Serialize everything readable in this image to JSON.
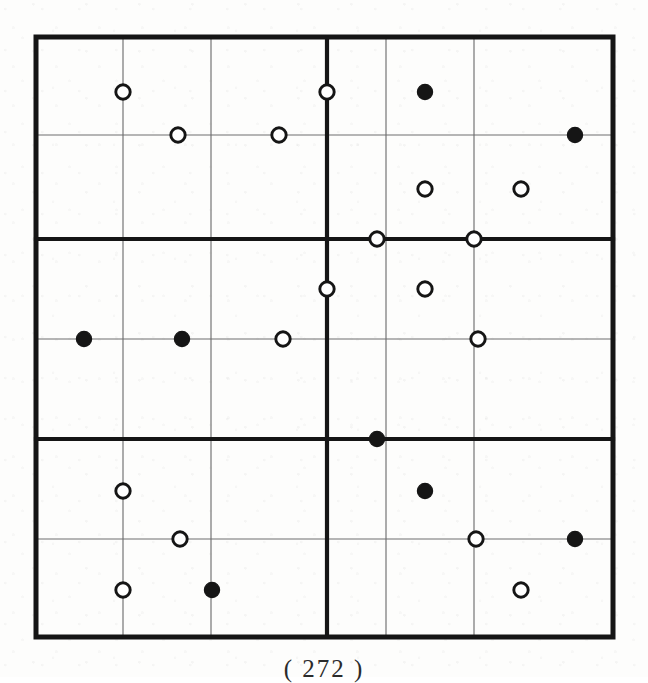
{
  "figure": {
    "caption": "( 272 )",
    "colors": {
      "ink": "#151515",
      "thin_line": "#6f6f6f",
      "paper": "#fdfdfc",
      "open_fill": "#ffffff",
      "closed_fill": "#151515"
    },
    "frame": {
      "left": 36,
      "top": 37,
      "right": 613,
      "bottom": 637,
      "outer_stroke_width": 5.0,
      "thick_stroke_width": 4.2,
      "thin_stroke_width": 1.15
    },
    "grid": {
      "description": "2 block-columns by 3 block-rows; each block holds 3 thin columns and 2 thin rows",
      "x_lattice": [
        36,
        123,
        211,
        327,
        386,
        474,
        613
      ],
      "y_lattice": [
        37,
        135,
        239,
        339,
        439,
        539,
        637
      ],
      "thick_vertical_x": [
        327
      ],
      "thick_horizontal_y": [
        239,
        439
      ],
      "thin_vertical_x": [
        123,
        211,
        386,
        474
      ],
      "thin_horizontal_y": [
        135,
        339,
        539
      ],
      "block_columns": 2,
      "block_rows": 3,
      "cell_columns_per_block": 3,
      "cell_rows_per_block": 2
    },
    "marker_style": {
      "open_radius": 7.2,
      "closed_radius": 7.6,
      "open_stroke_width": 2.9,
      "closed_stroke_width": 1.2,
      "open_symbol": "open-circle",
      "closed_symbol": "filled-circle"
    },
    "markers": [
      {
        "id": "m01",
        "x": 123,
        "y": 92,
        "type": "open",
        "block": "top-left"
      },
      {
        "id": "m02",
        "x": 327,
        "y": 92,
        "type": "open",
        "block": "top-center-line"
      },
      {
        "id": "m03",
        "x": 425,
        "y": 92,
        "type": "closed",
        "block": "top-right"
      },
      {
        "id": "m04",
        "x": 178,
        "y": 135,
        "type": "open",
        "block": "top-left"
      },
      {
        "id": "m05",
        "x": 279,
        "y": 135,
        "type": "open",
        "block": "top-left"
      },
      {
        "id": "m06",
        "x": 575,
        "y": 135,
        "type": "closed",
        "block": "top-right"
      },
      {
        "id": "m07",
        "x": 425,
        "y": 189,
        "type": "open",
        "block": "top-right"
      },
      {
        "id": "m08",
        "x": 521,
        "y": 189,
        "type": "open",
        "block": "top-right"
      },
      {
        "id": "m09",
        "x": 377,
        "y": 239,
        "type": "open",
        "block": "upper-thick-row"
      },
      {
        "id": "m10",
        "x": 474,
        "y": 239,
        "type": "open",
        "block": "upper-thick-row"
      },
      {
        "id": "m11",
        "x": 327,
        "y": 289,
        "type": "open",
        "block": "middle-center-line"
      },
      {
        "id": "m12",
        "x": 425,
        "y": 289,
        "type": "open",
        "block": "middle-right"
      },
      {
        "id": "m13",
        "x": 84,
        "y": 339,
        "type": "closed",
        "block": "middle-left"
      },
      {
        "id": "m14",
        "x": 182,
        "y": 339,
        "type": "closed",
        "block": "middle-left"
      },
      {
        "id": "m15",
        "x": 283,
        "y": 339,
        "type": "open",
        "block": "middle-left"
      },
      {
        "id": "m16",
        "x": 478,
        "y": 339,
        "type": "open",
        "block": "middle-right"
      },
      {
        "id": "m17",
        "x": 377,
        "y": 439,
        "type": "closed",
        "block": "lower-thick-row"
      },
      {
        "id": "m18",
        "x": 123,
        "y": 491,
        "type": "open",
        "block": "bottom-left"
      },
      {
        "id": "m19",
        "x": 425,
        "y": 491,
        "type": "closed",
        "block": "bottom-right"
      },
      {
        "id": "m20",
        "x": 180,
        "y": 539,
        "type": "open",
        "block": "bottom-left"
      },
      {
        "id": "m21",
        "x": 476,
        "y": 539,
        "type": "open",
        "block": "bottom-right"
      },
      {
        "id": "m22",
        "x": 575,
        "y": 539,
        "type": "closed",
        "block": "bottom-right"
      },
      {
        "id": "m23",
        "x": 123,
        "y": 590,
        "type": "open",
        "block": "bottom-left"
      },
      {
        "id": "m24",
        "x": 212,
        "y": 590,
        "type": "closed",
        "block": "bottom-left"
      },
      {
        "id": "m25",
        "x": 521,
        "y": 590,
        "type": "open",
        "block": "bottom-right"
      }
    ],
    "counts": {
      "total_markers": 25,
      "open_markers": 17,
      "closed_markers": 8
    }
  }
}
